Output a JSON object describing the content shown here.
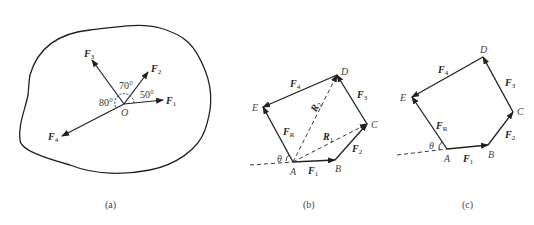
{
  "figure_a": {
    "caption": "(a)",
    "origin_label": "O",
    "forces": [
      {
        "name": "F",
        "sub": "1"
      },
      {
        "name": "F",
        "sub": "2"
      },
      {
        "name": "F",
        "sub": "3"
      },
      {
        "name": "F",
        "sub": "4"
      }
    ],
    "angles": [
      "50°",
      "70°",
      "80°"
    ]
  },
  "figure_b": {
    "caption": "(b)",
    "points": [
      "A",
      "B",
      "C",
      "D",
      "E"
    ],
    "forces": [
      {
        "name": "F",
        "sub": "1"
      },
      {
        "name": "F",
        "sub": "2"
      },
      {
        "name": "F",
        "sub": "3"
      },
      {
        "name": "F",
        "sub": "4"
      },
      {
        "name": "F",
        "sub": "R"
      }
    ],
    "resultants": [
      {
        "name": "R",
        "sub": "1"
      },
      {
        "name": "R",
        "sub": "2"
      }
    ],
    "angle": "θ"
  },
  "figure_c": {
    "caption": "(c)",
    "points": [
      "A",
      "B",
      "C",
      "D",
      "E"
    ],
    "forces": [
      {
        "name": "F",
        "sub": "1"
      },
      {
        "name": "F",
        "sub": "2"
      },
      {
        "name": "F",
        "sub": "3"
      },
      {
        "name": "F",
        "sub": "4"
      },
      {
        "name": "F",
        "sub": "R"
      }
    ],
    "angle": "θ"
  }
}
